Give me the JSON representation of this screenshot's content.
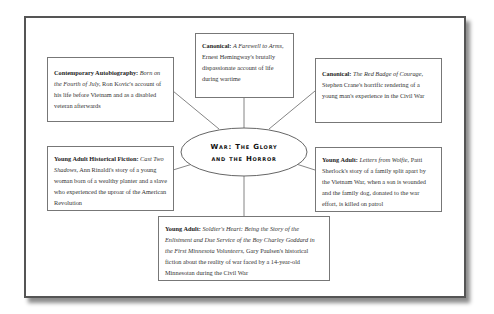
{
  "title": {
    "line1": "War: The Glory",
    "line2": "and the Horror"
  },
  "nodes": [
    {
      "id": "top",
      "category": "Canonical:",
      "work": "A Farewell to Arms,",
      "description": "Ernest Hemingway's brutally dispassionate account of life during wartime"
    },
    {
      "id": "top-left",
      "category": "Contemporary Autobiography:",
      "work": "Born on the Fourth of July,",
      "description": "Ron Kovic's account of his life before Vietnam and as a disabled veteran afterwards"
    },
    {
      "id": "top-right",
      "category": "Canonical:",
      "work": "The Red Badge of Courage,",
      "description": "Stephen Crane's horrific rendering of a young man's experience in the Civil War"
    },
    {
      "id": "mid-left",
      "category": "Young Adult Historical Fiction:",
      "work": "Cast Two Shadows,",
      "description": "Ann Rinaldi's story of a young woman born of a wealthy planter and a slave who experienced the uproar of the American Revolution"
    },
    {
      "id": "mid-right",
      "category": "Young Adult:",
      "work": "Letters from Wolfie,",
      "description": "Patti Sherlock's story of a family split apart by the Vietnam War, when a son is wounded and the family dog, donated to the war effort, is killed on patrol"
    },
    {
      "id": "bottom",
      "category": "Young Adult:",
      "work": "Soldier's Heart: Being the Story of the Enlistment and Due Service of the Boy Charley Goddard in the First Minnesota Volunteers,",
      "description": "Gary Paulsen's historical fiction about the reality of war faced by a 14-year-old Minnesotan during the Civil War"
    }
  ]
}
